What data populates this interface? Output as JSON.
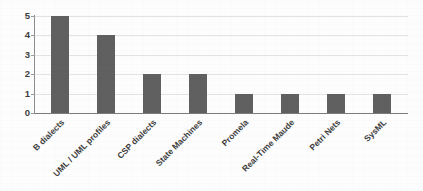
{
  "chart_data": {
    "type": "bar",
    "title": "",
    "xlabel": "",
    "ylabel": "",
    "categories": [
      "B dialects",
      "UML / UML profiles",
      "CSP dialects",
      "State Machines",
      "Promela",
      "Real-Time Maude",
      "Petri Nets",
      "SysML"
    ],
    "values": [
      5,
      4,
      2,
      2,
      1,
      1,
      1,
      1
    ],
    "ylim": [
      0,
      5
    ],
    "yticks": [
      "0",
      "1",
      "2",
      "3",
      "4",
      "5"
    ],
    "grid": "horizontal",
    "legend": "none",
    "bar_color": "#606060",
    "gridline_color": "#e3e3e3",
    "axis_color": "#8d8d8d",
    "text_color": "#3d3d3d",
    "background_color": "#fdfdfd"
  }
}
